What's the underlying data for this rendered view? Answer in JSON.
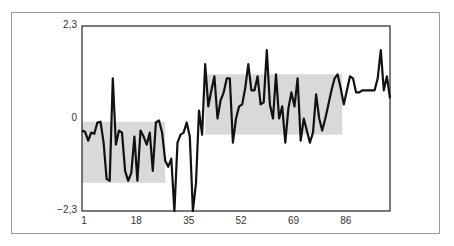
{
  "chart_data": {
    "type": "line",
    "title": "",
    "xlabel": "",
    "ylabel": "",
    "xlim": [
      1,
      101
    ],
    "ylim": [
      -2.3,
      2.3
    ],
    "grid": false,
    "legend": null,
    "x_ticks": [
      "1",
      "18",
      "35",
      "52",
      "69",
      "86"
    ],
    "x_tick_values": [
      1,
      18,
      35,
      52,
      69,
      86
    ],
    "y_ticks": [
      "2,3",
      "0",
      "−2,3"
    ],
    "y_tick_values": [
      2.3,
      0,
      -2.3
    ],
    "shaded_regions": [
      {
        "x_start": 1,
        "x_end": 28,
        "y_low": -1.6,
        "y_high": -0.08,
        "color": "#d9d9d9"
      },
      {
        "x_start": 41,
        "x_end": 85.5,
        "y_low": -0.4,
        "y_high": 1.1,
        "color": "#d9d9d9"
      }
    ],
    "series": [
      {
        "name": "series",
        "color": "#111111",
        "x": [
          1,
          2,
          3,
          4,
          5,
          6,
          7,
          8,
          9,
          10,
          11,
          12,
          13,
          14,
          15,
          16,
          17,
          18,
          19,
          20,
          21,
          22,
          23,
          24,
          25,
          26,
          27,
          28,
          29,
          30,
          31,
          32,
          33,
          34,
          35,
          36,
          37,
          38,
          39,
          40,
          41,
          42,
          43,
          44,
          45,
          46,
          47,
          48,
          49,
          50,
          51,
          52,
          53,
          54,
          55,
          56,
          57,
          58,
          59,
          60,
          61,
          62,
          63,
          64,
          65,
          66,
          67,
          68,
          69,
          70,
          71,
          72,
          73,
          74,
          75,
          76,
          77,
          78,
          79,
          80,
          81,
          82,
          83,
          84,
          85,
          86,
          87,
          88,
          89,
          90,
          91,
          92,
          93,
          94,
          95,
          96,
          97,
          98,
          99,
          100,
          101
        ],
        "values": [
          -0.3,
          -0.33,
          -0.55,
          -0.35,
          -0.38,
          -0.1,
          -0.08,
          -0.6,
          -1.5,
          -1.55,
          1.0,
          -0.65,
          -0.3,
          -0.35,
          -1.3,
          -1.55,
          -1.35,
          -0.45,
          -1.55,
          -0.3,
          -0.45,
          -0.65,
          -0.35,
          -1.3,
          -0.1,
          -0.05,
          -0.35,
          -1.05,
          -1.2,
          -1.0,
          -2.3,
          -0.6,
          -0.4,
          -0.35,
          -0.1,
          -0.45,
          -2.3,
          -1.6,
          0.2,
          -0.4,
          1.35,
          0.3,
          0.7,
          1.05,
          0.0,
          0.45,
          0.65,
          1.0,
          1.0,
          -0.6,
          0.0,
          0.3,
          0.35,
          0.75,
          1.35,
          0.7,
          0.7,
          1.05,
          0.35,
          0.4,
          1.7,
          0.35,
          0.0,
          1.1,
          0.0,
          0.3,
          -0.6,
          0.25,
          0.65,
          0.3,
          1.0,
          -0.55,
          0.0,
          -0.3,
          -0.6,
          -0.35,
          0.6,
          0.0,
          -0.3,
          0.0,
          0.35,
          0.7,
          1.0,
          1.1,
          0.75,
          0.35,
          0.7,
          1.05,
          1.0,
          0.65,
          0.65,
          0.7,
          0.7,
          0.7,
          0.7,
          0.7,
          1.0,
          1.7,
          0.7,
          1.05,
          0.5
        ]
      }
    ]
  }
}
